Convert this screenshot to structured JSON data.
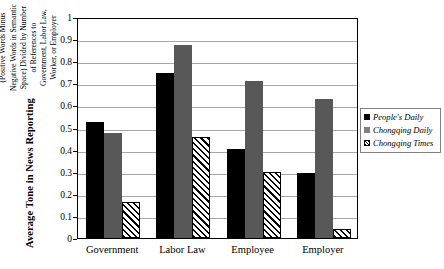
{
  "chart_data": {
    "type": "bar",
    "title": "",
    "ylabel": "Average Tone in News Reporting",
    "ylabel_sub": "(Positive Words Minus Negative Words in Semantic Space) Divided by Number of References to Government, Labor Law, Worker, or Employer",
    "xlabel": "",
    "categories": [
      "Government",
      "Labor Law",
      "Employee",
      "Employer"
    ],
    "series": [
      {
        "name": "People's Daily",
        "values": [
          0.525,
          0.748,
          0.405,
          0.295
        ],
        "color": "#000000",
        "pattern": "solid"
      },
      {
        "name": "Chongqing Daily",
        "values": [
          0.475,
          0.875,
          0.712,
          0.63
        ],
        "color": "#585858",
        "pattern": "solid"
      },
      {
        "name": "Chongqing Times",
        "values": [
          0.165,
          0.455,
          0.3,
          0.042
        ],
        "color": "#ffffff",
        "pattern": "diagonal-hatch"
      }
    ],
    "ylim": [
      0,
      1
    ],
    "yticks": [
      "0",
      "0.1",
      "0.2",
      "0.3",
      "0.4",
      "0.5",
      "0.6",
      "0.7",
      "0.8",
      "0.9",
      "1"
    ],
    "ytick_values": [
      0,
      0.1,
      0.2,
      0.3,
      0.4,
      0.5,
      0.6,
      0.7,
      0.8,
      0.9,
      1
    ],
    "grid": true,
    "grid_axis": "y",
    "legend_position": "right",
    "gridline_color": "#a6a6a6",
    "axis_color": "#000000"
  },
  "legend": {
    "entries": [
      {
        "label": "People's Daily"
      },
      {
        "label": "Chongqing Daily"
      },
      {
        "label": "Chongqing Times"
      }
    ]
  }
}
